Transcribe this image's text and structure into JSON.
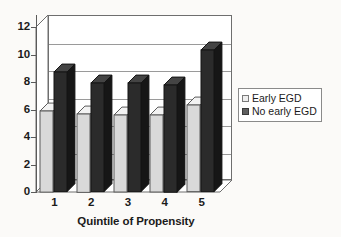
{
  "chart_data": {
    "type": "bar",
    "title": "",
    "subtitle": "",
    "xlabel": "Quintile of Propensity",
    "ylabel": "",
    "categories": [
      "1",
      "2",
      "3",
      "4",
      "5"
    ],
    "series": [
      {
        "name": "Early EGD",
        "values": [
          5.9,
          5.7,
          5.6,
          5.6,
          6.3
        ],
        "color": "#d9d9d9"
      },
      {
        "name": "No early EGD",
        "values": [
          8.7,
          7.9,
          7.9,
          7.8,
          10.3
        ],
        "color": "#2b2b2b"
      }
    ],
    "ylim": [
      0,
      12
    ],
    "ytick_labels": [
      "0",
      "2",
      "4",
      "6",
      "8",
      "10",
      "12"
    ],
    "ytick_values": [
      0,
      2,
      4,
      6,
      8,
      10,
      12
    ],
    "grid": true,
    "grid_axis": "y",
    "legend_position": "right",
    "three_d": true
  },
  "legend": {
    "items": [
      {
        "label": "Early EGD",
        "swatch": "light"
      },
      {
        "label": "No early EGD",
        "swatch": "dark"
      }
    ]
  },
  "colors": {
    "background": "#fbfaf8",
    "plot_background": "#ffffff",
    "axis": "#5a5a5a",
    "gridline": "#9a9a9a",
    "series_light": "#d9d9d9",
    "series_dark": "#2b2b2b",
    "text": "#1b1b1b"
  }
}
